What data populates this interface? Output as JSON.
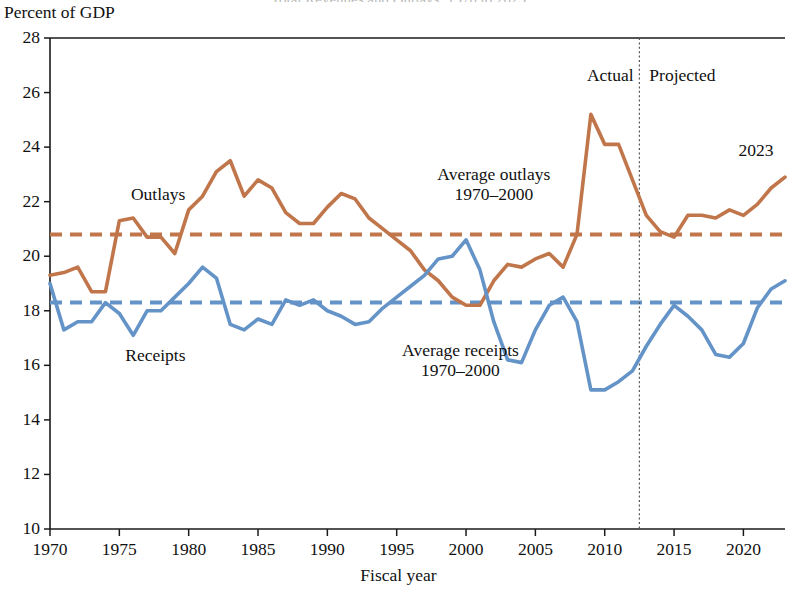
{
  "figure": {
    "cut_off_top_title": "Total Revenues and Outlays, 1970 to 2023",
    "y_axis_unit_label": "Percent of GDP",
    "x_axis_title": "Fiscal year"
  },
  "annotations": {
    "outlays_label": "Outlays",
    "receipts_label": "Receipts",
    "average_outlays_line1": "Average outlays",
    "average_outlays_line2": "1970–2000",
    "average_receipts_line1": "Average receipts",
    "average_receipts_line2": "1970–2000",
    "actual_label": "Actual",
    "projected_label": "Projected",
    "end_year_label": "2023"
  },
  "colors": {
    "outlays": "#c0764a",
    "receipts": "#6493c8",
    "axis": "#1a1a1a",
    "divider": "#555555"
  },
  "chart_data": {
    "type": "line",
    "title": "Total Revenues and Outlays, 1970 to 2023",
    "xlabel": "Fiscal year",
    "ylabel": "Percent of GDP",
    "xlim": [
      1970,
      2023
    ],
    "ylim": [
      10,
      28
    ],
    "ytick_labels": [
      28,
      26,
      24,
      22,
      20,
      18,
      16,
      14,
      12,
      10
    ],
    "xtick_labels": [
      1970,
      1975,
      1980,
      1985,
      1990,
      1995,
      2000,
      2005,
      2010,
      2015,
      2020
    ],
    "grid": false,
    "legend": "inline-annotations",
    "actual_projected_split_year": 2012.5,
    "x": [
      1970,
      1971,
      1972,
      1973,
      1974,
      1975,
      1976,
      1977,
      1978,
      1979,
      1980,
      1981,
      1982,
      1983,
      1984,
      1985,
      1986,
      1987,
      1988,
      1989,
      1990,
      1991,
      1992,
      1993,
      1994,
      1995,
      1996,
      1997,
      1998,
      1999,
      2000,
      2001,
      2002,
      2003,
      2004,
      2005,
      2006,
      2007,
      2008,
      2009,
      2010,
      2011,
      2012,
      2013,
      2014,
      2015,
      2016,
      2017,
      2018,
      2019,
      2020,
      2021,
      2022,
      2023
    ],
    "series": [
      {
        "name": "Outlays",
        "color": "#c0764a",
        "style": "solid",
        "values": [
          19.3,
          19.4,
          19.6,
          18.7,
          18.7,
          21.3,
          21.4,
          20.7,
          20.7,
          20.1,
          21.7,
          22.2,
          23.1,
          23.5,
          22.2,
          22.8,
          22.5,
          21.6,
          21.2,
          21.2,
          21.8,
          22.3,
          22.1,
          21.4,
          21.0,
          20.6,
          20.2,
          19.5,
          19.1,
          18.5,
          18.2,
          18.2,
          19.1,
          19.7,
          19.6,
          19.9,
          20.1,
          19.6,
          20.8,
          25.2,
          24.1,
          24.1,
          22.8,
          21.5,
          20.9,
          20.7,
          21.5,
          21.5,
          21.4,
          21.7,
          21.5,
          21.9,
          22.5,
          22.9
        ],
        "label_text": "Outlays"
      },
      {
        "name": "Receipts",
        "color": "#6493c8",
        "style": "solid",
        "values": [
          19.0,
          17.3,
          17.6,
          17.6,
          18.3,
          17.9,
          17.1,
          18.0,
          18.0,
          18.5,
          19.0,
          19.6,
          19.2,
          17.5,
          17.3,
          17.7,
          17.5,
          18.4,
          18.2,
          18.4,
          18.0,
          17.8,
          17.5,
          17.6,
          18.1,
          18.5,
          18.9,
          19.3,
          19.9,
          20.0,
          20.6,
          19.5,
          17.6,
          16.2,
          16.1,
          17.3,
          18.2,
          18.5,
          17.6,
          15.1,
          15.1,
          15.4,
          15.8,
          16.7,
          17.5,
          18.2,
          17.8,
          17.3,
          16.4,
          16.3,
          16.8,
          18.1,
          18.8,
          19.1
        ],
        "label_text": "Receipts"
      },
      {
        "name": "Average outlays 1970-2000",
        "color": "#c0764a",
        "style": "dashed",
        "constant_value": 20.8
      },
      {
        "name": "Average receipts 1970-2000",
        "color": "#6493c8",
        "style": "dashed",
        "constant_value": 18.3
      }
    ]
  },
  "geometry": {
    "plot_left": 50,
    "plot_right": 785,
    "plot_top": 38,
    "plot_bottom": 529
  }
}
